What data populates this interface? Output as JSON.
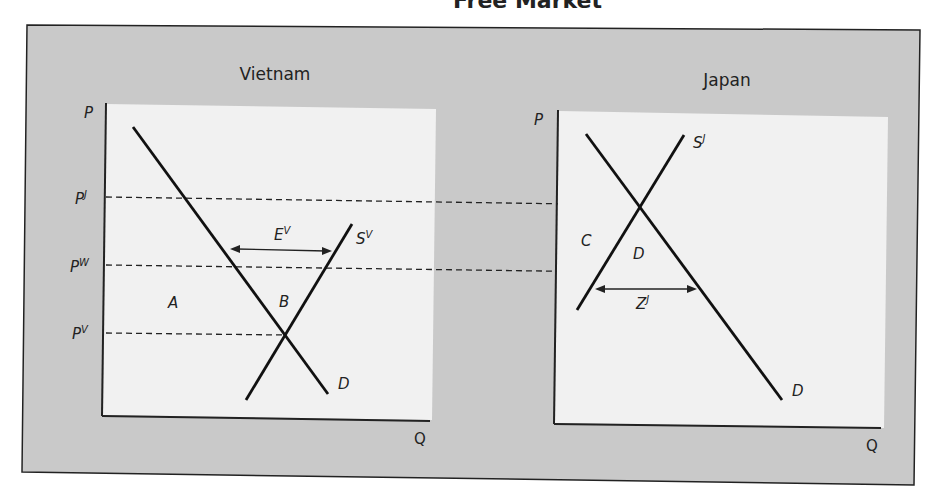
{
  "figure": {
    "title_partial": "Free Market",
    "panels": [
      {
        "name": "Vietnam",
        "axis_labels": {
          "y": "P",
          "x": "Q"
        },
        "price_labels": [
          {
            "base": "P",
            "sup": "J"
          },
          {
            "base": "P",
            "sup": "W"
          },
          {
            "base": "P",
            "sup": "V"
          }
        ],
        "curves": {
          "demand": "D",
          "supply": {
            "base": "S",
            "sup": "V"
          }
        },
        "areas": [
          "A",
          "B"
        ],
        "arrow_label": {
          "base": "E",
          "sup": "V"
        }
      },
      {
        "name": "Japan",
        "axis_labels": {
          "y": "P",
          "x": "Q"
        },
        "curves": {
          "demand": "D",
          "supply": {
            "base": "S",
            "sup": "J"
          }
        },
        "areas": [
          "C",
          "D"
        ],
        "arrow_label": {
          "base": "Z",
          "sup": "J"
        }
      }
    ],
    "colors": {
      "frame_bg": "#c9c9c9",
      "plot_bg": "#f1f1f1",
      "line": "#1a1a1a"
    }
  }
}
